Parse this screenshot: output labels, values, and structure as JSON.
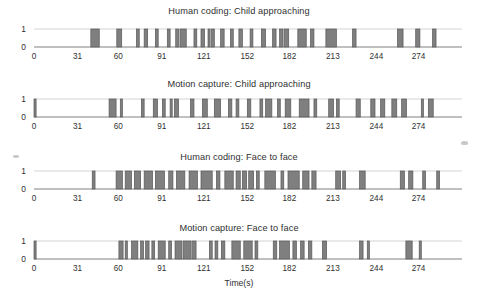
{
  "figure": {
    "background_color": "#ffffff",
    "bar_color": "#7f7f7f",
    "bar_edge_color": "#595959",
    "axis_color": "#808080",
    "text_color": "#2f2f2f",
    "x_axis_label": "Time(s)",
    "y_tick_labels": [
      "1",
      "0"
    ],
    "x_tick_labels": [
      "0",
      "31",
      "60",
      "91",
      "121",
      "152",
      "182",
      "213",
      "244",
      "274"
    ]
  },
  "chart_data": [
    {
      "type": "area",
      "title": "Human coding: Child approaching",
      "xlabel": "",
      "ylabel": "",
      "ylim": [
        0,
        1
      ],
      "xlim": [
        0,
        305
      ],
      "yticks": [
        0,
        1
      ],
      "xticks": [
        0,
        31,
        60,
        91,
        121,
        152,
        182,
        213,
        244,
        274
      ],
      "grid": false,
      "legend": "none",
      "signal_name": "Child approaching (human coded)",
      "description": "Binary square wave: value 1 during coded events, 0 otherwise",
      "intervals": [
        [
          40.5,
          46.5
        ],
        [
          59.0,
          62.5
        ],
        [
          73.0,
          75.0
        ],
        [
          78.5,
          81.0
        ],
        [
          86.5,
          88.5
        ],
        [
          95.0,
          97.0
        ],
        [
          101.0,
          103.0
        ],
        [
          104.0,
          108.5
        ],
        [
          114.0,
          116.0
        ],
        [
          119.0,
          121.5
        ],
        [
          124.0,
          125.5
        ],
        [
          126.5,
          128.5
        ],
        [
          133.0,
          135.5
        ],
        [
          140.0,
          142.0
        ],
        [
          146.0,
          148.5
        ],
        [
          154.0,
          156.0
        ],
        [
          162.0,
          165.0
        ],
        [
          170.0,
          172.5
        ],
        [
          175.0,
          177.5
        ],
        [
          178.5,
          181.5
        ],
        [
          188.0,
          194.0
        ],
        [
          197.0,
          199.5
        ],
        [
          208.0,
          215.5
        ],
        [
          227.0,
          229.5
        ],
        [
          259.0,
          263.0
        ],
        [
          272.0,
          275.0
        ],
        [
          284.0,
          286.5
        ]
      ]
    },
    {
      "type": "area",
      "title": "Motion capture: Child approaching",
      "xlabel": "",
      "ylabel": "",
      "ylim": [
        0,
        1
      ],
      "xlim": [
        0,
        305
      ],
      "yticks": [
        0,
        1
      ],
      "xticks": [
        0,
        31,
        60,
        91,
        121,
        152,
        182,
        213,
        244,
        274
      ],
      "grid": false,
      "legend": "none",
      "signal_name": "Child approaching (motion capture)",
      "description": "Binary square wave: value 1 during detected events, 0 otherwise",
      "intervals": [
        [
          0.0,
          1.5
        ],
        [
          53.5,
          58.5
        ],
        [
          61.5,
          63.0
        ],
        [
          76.5,
          78.5
        ],
        [
          85.0,
          88.0
        ],
        [
          91.5,
          93.5
        ],
        [
          97.0,
          98.5
        ],
        [
          100.0,
          103.0
        ],
        [
          111.5,
          114.0
        ],
        [
          120.0,
          123.5
        ],
        [
          128.5,
          133.0
        ],
        [
          138.5,
          141.0
        ],
        [
          144.0,
          146.0
        ],
        [
          152.0,
          154.5
        ],
        [
          161.0,
          163.0
        ],
        [
          165.0,
          169.5
        ],
        [
          173.5,
          175.5
        ],
        [
          179.0,
          183.0
        ],
        [
          189.0,
          196.0
        ],
        [
          199.5,
          201.5
        ],
        [
          210.0,
          213.5
        ],
        [
          215.5,
          217.5
        ],
        [
          229.5,
          232.5
        ],
        [
          240.0,
          243.0
        ],
        [
          247.0,
          250.0
        ],
        [
          255.0,
          258.5
        ],
        [
          262.0,
          265.5
        ],
        [
          276.0,
          277.5
        ],
        [
          281.0,
          284.5
        ]
      ]
    },
    {
      "type": "area",
      "title": "Human coding: Face to face",
      "xlabel": "",
      "ylabel": "",
      "ylim": [
        0,
        1
      ],
      "xlim": [
        0,
        305
      ],
      "yticks": [
        0,
        1
      ],
      "xticks": [
        0,
        31,
        60,
        91,
        121,
        152,
        182,
        213,
        244,
        274
      ],
      "grid": false,
      "legend": "none",
      "signal_name": "Face to face (human coded)",
      "description": "Binary square wave: value 1 during coded events, 0 otherwise",
      "intervals": [
        [
          41.5,
          43.5
        ],
        [
          58.5,
          63.0
        ],
        [
          65.0,
          69.5
        ],
        [
          71.5,
          76.0
        ],
        [
          78.5,
          84.5
        ],
        [
          86.5,
          93.0
        ],
        [
          96.0,
          99.0
        ],
        [
          101.5,
          107.5
        ],
        [
          110.5,
          116.5
        ],
        [
          119.0,
          127.0
        ],
        [
          130.0,
          132.5
        ],
        [
          136.0,
          142.0
        ],
        [
          144.0,
          147.0
        ],
        [
          148.5,
          151.5
        ],
        [
          153.0,
          156.5
        ],
        [
          158.5,
          160.5
        ],
        [
          164.5,
          172.0
        ],
        [
          176.0,
          178.0
        ],
        [
          181.0,
          189.0
        ],
        [
          191.5,
          196.0
        ],
        [
          198.0,
          201.0
        ],
        [
          215.0,
          218.5
        ],
        [
          220.0,
          222.0
        ],
        [
          232.0,
          236.0
        ],
        [
          261.0,
          264.0
        ],
        [
          267.0,
          270.0
        ],
        [
          277.0,
          279.0
        ],
        [
          287.0,
          289.0
        ]
      ]
    },
    {
      "type": "area",
      "title": "Motion capture: Face to face",
      "xlabel": "Time(s)",
      "ylabel": "",
      "ylim": [
        0,
        1
      ],
      "xlim": [
        0,
        305
      ],
      "yticks": [
        0,
        1
      ],
      "xticks": [
        0,
        31,
        60,
        91,
        121,
        152,
        182,
        213,
        244,
        274
      ],
      "grid": false,
      "legend": "none",
      "signal_name": "Face to face (motion capture)",
      "description": "Binary square wave: value 1 during detected events, 0 otherwise",
      "intervals": [
        [
          0.0,
          1.5
        ],
        [
          60.5,
          63.5
        ],
        [
          65.0,
          66.5
        ],
        [
          69.5,
          74.0
        ],
        [
          76.0,
          78.0
        ],
        [
          79.5,
          82.0
        ],
        [
          84.0,
          86.0
        ],
        [
          88.5,
          93.5
        ],
        [
          96.0,
          98.0
        ],
        [
          100.5,
          105.5
        ],
        [
          106.5,
          112.0
        ],
        [
          113.0,
          115.5
        ],
        [
          125.0,
          127.0
        ],
        [
          129.0,
          131.0
        ],
        [
          133.5,
          136.0
        ],
        [
          141.0,
          147.0
        ],
        [
          149.5,
          155.5
        ],
        [
          157.5,
          159.5
        ],
        [
          170.5,
          173.0
        ],
        [
          175.0,
          182.0
        ],
        [
          184.5,
          187.0
        ],
        [
          190.0,
          192.5
        ],
        [
          195.5,
          198.0
        ],
        [
          205.5,
          208.5
        ],
        [
          232.0,
          234.5
        ],
        [
          237.5,
          239.0
        ],
        [
          265.0,
          269.5
        ],
        [
          274.5,
          276.0
        ]
      ]
    }
  ]
}
